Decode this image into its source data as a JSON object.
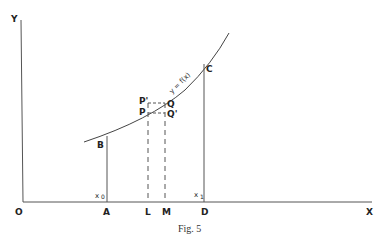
{
  "figure": {
    "caption": "Fig. 5",
    "axes": {
      "y_label": "Y",
      "x_label": "X",
      "origin_label": "O"
    },
    "curve": {
      "label": "y = f(x)"
    },
    "points": {
      "B": "B",
      "C": "C",
      "P": "P",
      "P_prime": "P'",
      "Q": "Q",
      "Q_prime": "Q'"
    },
    "x_axis_points": {
      "A": "A",
      "L": "L",
      "M": "M",
      "D": "D"
    },
    "bounds": {
      "x0": "x",
      "x0_sub": "0",
      "x1": "x",
      "x1_sub": "1"
    },
    "colors": {
      "line": "#555555",
      "text": "#222222"
    }
  }
}
